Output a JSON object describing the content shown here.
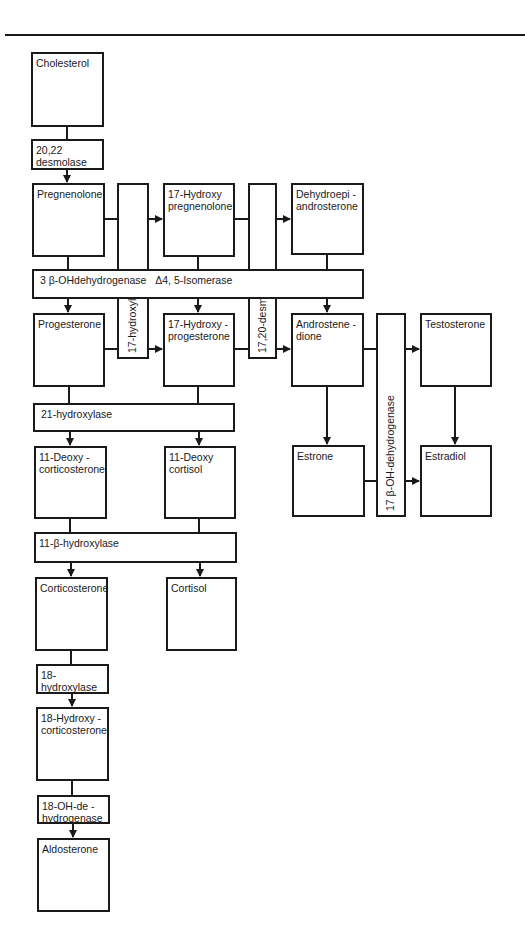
{
  "diagram": {
    "title_rule": true,
    "substrates": {
      "cholesterol": "Cholesterol",
      "pregnenolone": "Pregnenolone",
      "hydroxy_pregnenolone": "17-Hydroxy\npregnenolone",
      "dhea": "Dehydroepi -\nandrosterone",
      "progesterone": "Progesterone",
      "hydroxy_progesterone": "17-Hydroxy -\nprogesterone",
      "androstenedione": "Androstene -\ndione",
      "testosterone": "Testosterone",
      "deoxycorticosterone": "11-Deoxy -\ncorticosterone",
      "deoxycortisol": "11-Deoxy\ncortisol",
      "estrone": "Estrone",
      "estradiol": "Estradiol",
      "corticosterone": "Corticosterone",
      "cortisol": "Cortisol",
      "hydroxycorticosterone": "18-Hydroxy -\ncorticosterone",
      "aldosterone": "Aldosterone"
    },
    "enzymes": {
      "desmolase_20_22": "20,22\ndesmolase",
      "hydroxylase_17": "17-hydroxylase",
      "desmolase_17_20": "17,20-desmolase",
      "hsd_3beta": "3 β-OHdehydrogenase   Δ4, 5-Isomerase",
      "hsd_17beta": "17 β-OH-dehydrogenase",
      "hydroxylase_21": "21-hydroxylase",
      "hydroxylase_11beta": "11-β-hydroxylase",
      "hydroxylase_18": "18-\nhydroxylase",
      "oh_dehydrogenase_18": "18-OH-de -\nhydrogenase"
    },
    "colors": {
      "line": "#1a1a1a",
      "background": "#ffffff"
    }
  }
}
